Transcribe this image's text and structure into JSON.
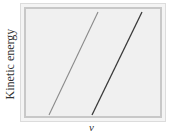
{
  "chart_data": {
    "type": "line",
    "title": "",
    "xlabel": "v",
    "ylabel": "Kinetic energy",
    "grid": false,
    "legend": null,
    "axis_ticks": false,
    "series": [
      {
        "name": "line-1",
        "color": "#8a8a8a",
        "points": [
          [
            49,
            115
          ],
          [
            98,
            12
          ]
        ]
      },
      {
        "name": "line-2",
        "color": "#3a3a3a",
        "points": [
          [
            92,
            115
          ],
          [
            142,
            12
          ]
        ]
      }
    ]
  },
  "labels": {
    "x": "v",
    "y": "Kinetic energy"
  }
}
